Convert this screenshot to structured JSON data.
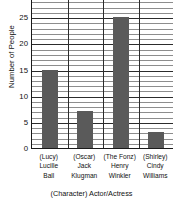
{
  "chart_data": {
    "type": "bar",
    "title": "",
    "xlabel": "(Character) Actor/Actress",
    "ylabel": "Number of People",
    "categories": [
      "(Lucy) Lucille Ball",
      "(Oscar) Jack Klugman",
      "(The Fonz) Henry Winkler",
      "(Shirley) Cindy Williams"
    ],
    "category_lines": [
      [
        "(Lucy)",
        "Lucille",
        "Ball"
      ],
      [
        "(Oscar)",
        "Jack",
        "Klugman"
      ],
      [
        "(The Fonz)",
        "Henry",
        "Winkler"
      ],
      [
        "(Shirley)",
        "Cindy",
        "Williams"
      ]
    ],
    "values": [
      15,
      7,
      25,
      3
    ],
    "ylim": [
      0,
      30
    ],
    "ytick_labels": [
      "0",
      "5",
      "10",
      "15",
      "20",
      "25",
      "30"
    ],
    "ytick_values": [
      0,
      5,
      10,
      15,
      20,
      25,
      30
    ],
    "minor_tick_step": 1,
    "grid": "horizontal-and-vertical",
    "legend": "none",
    "bar_color": "#5a5a5a",
    "grid_color": "#8d8d8d",
    "axis_color": "#1a1a1a",
    "note_top_label_clipped": "30"
  }
}
